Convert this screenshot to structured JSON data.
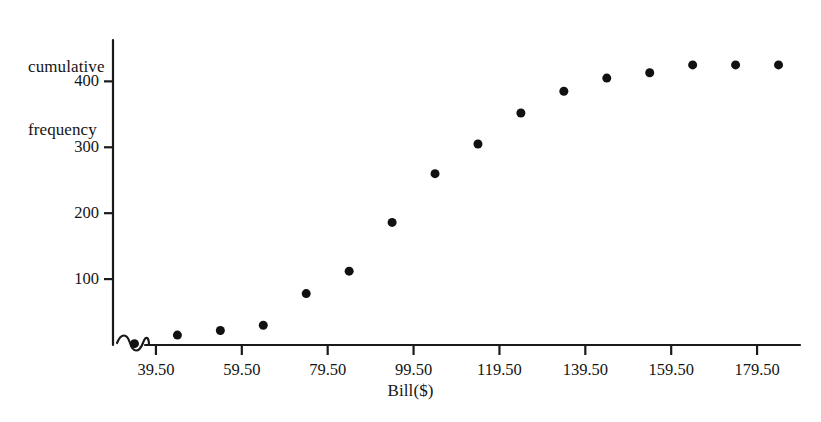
{
  "chart_data": {
    "type": "scatter",
    "title": "",
    "xlabel": "Bill($)",
    "ylabel": "cumulative frequency",
    "ylabel_lines": [
      "cumulative",
      "frequency"
    ],
    "x": [
      34.5,
      44.5,
      54.5,
      64.5,
      74.5,
      84.5,
      94.5,
      104.5,
      114.5,
      124.5,
      134.5,
      144.5,
      154.5,
      164.5,
      174.5,
      184.5
    ],
    "values": [
      2,
      15,
      22,
      30,
      78,
      112,
      186,
      260,
      305,
      352,
      385,
      405,
      413,
      425,
      425,
      425
    ],
    "xlim": [
      29.5,
      189.5
    ],
    "ylim": [
      0,
      440
    ],
    "x_ticks": [
      39.5,
      59.5,
      79.5,
      99.5,
      119.5,
      139.5,
      159.5,
      179.5
    ],
    "x_tick_labels": [
      "39.50",
      "59.50",
      "79.50",
      "99.50",
      "119.50",
      "139.50",
      "159.50",
      "179.50"
    ],
    "y_ticks": [
      100,
      200,
      300,
      400
    ],
    "y_tick_labels": [
      "100",
      "200",
      "300",
      "400"
    ],
    "grid": false,
    "legend": "none",
    "axis_break": {
      "axis": "x",
      "symbol": "squiggle",
      "position": "origin"
    },
    "marker": {
      "shape": "circle",
      "color": "#111111",
      "size": 9
    },
    "axis_color": "#1a1a1a"
  }
}
